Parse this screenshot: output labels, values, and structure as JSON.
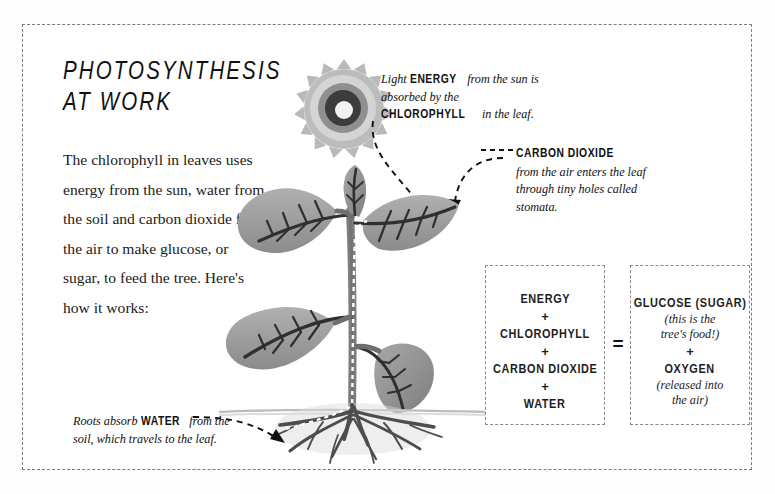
{
  "poster": {
    "title": "PHOTOSYNTHESIS\nAT WORK",
    "intro": "The chlorophyll in leaves uses energy from the sun, water from the soil and carbon dioxide from the air to make glucose, or sugar, to feed the tree. Here's how it works:"
  },
  "annotations": {
    "light": {
      "part1": "Light ",
      "caps1": "ENERGY",
      "part2": " from the sun is absorbed by the ",
      "caps2": "CHLOROPHYLL",
      "part3": " in the leaf."
    },
    "carbon_dioxide": {
      "heading": "CARBON DIOXIDE",
      "body": "from the air enters the leaf through tiny holes called stomata."
    },
    "roots": {
      "part1": "Roots absorb ",
      "caps1": "WATER",
      "part2": " from the soil, which travels to the leaf."
    }
  },
  "equation": {
    "reactants": {
      "items": [
        "ENERGY",
        "CHLOROPHYLL",
        "CARBON DIOXIDE",
        "WATER"
      ],
      "operator": "+"
    },
    "operator_equals": "=",
    "products": {
      "glucose": "GLUCOSE (SUGAR)",
      "glucose_note": "(this is the\ntree's food!)",
      "operator": "+",
      "oxygen": "OXYGEN",
      "oxygen_note": "(released into\nthe air)"
    }
  },
  "illustration": {
    "sun": "sun-illustration",
    "plant": "plant-illustration",
    "roots": "roots-illustration",
    "soil_line": "soil-line",
    "water_path": "water-path-dashed-line",
    "arrows": [
      "light-arrow",
      "carbon-dioxide-arrow",
      "roots-arrow"
    ]
  },
  "colors": {
    "ink": "#1d1d1d",
    "border": "#7b7b7b",
    "leaf": "#9a9a9a",
    "leaf_dark": "#6e6e6e",
    "vein": "#2e2e2e",
    "sun_outer": "#b5b5b5",
    "sun_mid": "#d8d8d8",
    "sun_ring": "#3a3a3a",
    "soil": "#c9c9c9",
    "background": "#ffffff"
  }
}
